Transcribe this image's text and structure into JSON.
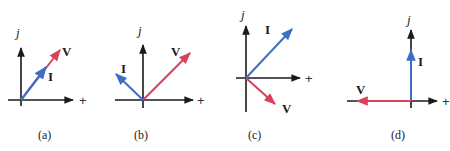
{
  "colors": {
    "axis": "#1a1a1a",
    "voltage": "#d9405a",
    "current": "#3e6fc4"
  },
  "axis_labels": {
    "imaginary": "j",
    "real": "+"
  },
  "panels": [
    {
      "id": "a",
      "caption": "(a)",
      "description": "V and I in phase (resistive)",
      "vectors": [
        {
          "label": "V",
          "quantity": "voltage",
          "angle_deg": 50
        },
        {
          "label": "I",
          "quantity": "current",
          "angle_deg": 50
        }
      ]
    },
    {
      "id": "b",
      "caption": "(b)",
      "description": "I leads V",
      "vectors": [
        {
          "label": "V",
          "quantity": "voltage",
          "angle_deg": 40
        },
        {
          "label": "I",
          "quantity": "current",
          "angle_deg": 135
        }
      ]
    },
    {
      "id": "c",
      "caption": "(c)",
      "description": "I leads V by 90 degrees",
      "vectors": [
        {
          "label": "I",
          "quantity": "current",
          "angle_deg": 40
        },
        {
          "label": "V",
          "quantity": "voltage",
          "angle_deg": -45
        }
      ]
    },
    {
      "id": "d",
      "caption": "(d)",
      "description": "I at 90, V at 180",
      "vectors": [
        {
          "label": "I",
          "quantity": "current",
          "angle_deg": 90
        },
        {
          "label": "V",
          "quantity": "voltage",
          "angle_deg": 180
        }
      ]
    }
  ]
}
